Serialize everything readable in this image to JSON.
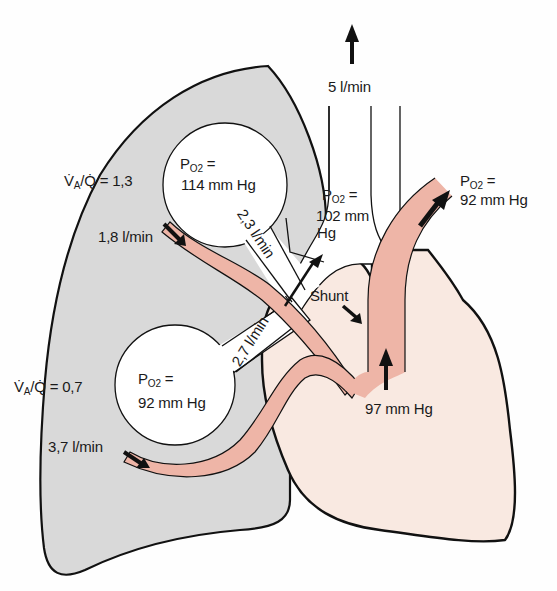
{
  "diagram": {
    "type": "physiology",
    "colors": {
      "lung_fill": "#d8d8d8",
      "heart_fill": "#f9e8e0",
      "vessel_fill": "#eeb4a6",
      "alveolus_fill": "#ffffff",
      "outline": "#111111"
    }
  },
  "labels": {
    "total_flow": "5 l/min",
    "upper_ratio": "V̇A/Q̇ = 1,3",
    "upper_ratio_prefix": "V̇",
    "upper_ratio_sub": "A",
    "upper_ratio_rest": "/Q̇ = 1,3",
    "upper_alveolus_po2_line1": "P",
    "upper_alveolus_po2_sub": "O2",
    "upper_alveolus_po2_eq": " =",
    "upper_alveolus_po2_value": "114 mm Hg",
    "upper_blood_flow": "1,8 l/min",
    "upper_vent_flow": "2,3 l/min",
    "lower_vent_flow": "2,7 l/min",
    "mixed_alveolar_po2_line1": "P",
    "mixed_alveolar_po2_sub": "O2",
    "mixed_alveolar_po2_eq": " =",
    "mixed_alveolar_po2_value1": "102 mm",
    "mixed_alveolar_po2_value2": "Hg",
    "lower_ratio_prefix": "V̇",
    "lower_ratio_sub": "A",
    "lower_ratio_rest": "/Q̇ = 0,7",
    "lower_alveolus_po2_line1": "P",
    "lower_alveolus_po2_sub": "O2",
    "lower_alveolus_po2_eq": " =",
    "lower_alveolus_po2_value": "92 mm Hg",
    "lower_blood_flow": "3,7 l/min",
    "shunt": "Shunt",
    "pulmonary_vein_po2": "97 mm Hg",
    "arterial_po2_line1": "P",
    "arterial_po2_sub": "O2",
    "arterial_po2_eq": " =",
    "arterial_po2_value": "92 mm Hg"
  }
}
